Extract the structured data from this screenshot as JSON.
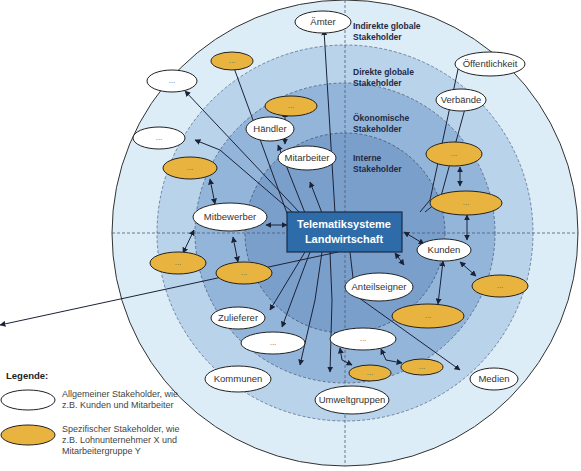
{
  "center": {
    "line1": "Telematiksysteme",
    "line2": "Landwirtschaft",
    "fill": "#2d6ca8"
  },
  "rings": [
    {
      "label1": "Indirekte globale",
      "label2": "Stakeholder",
      "fill": "#dcedf8"
    },
    {
      "label1": "Direkte globale",
      "label2": "Stakeholder",
      "fill": "#b9d3ea"
    },
    {
      "label1": "Ökonomische",
      "label2": "Stakeholder",
      "fill": "#93b5d9"
    },
    {
      "label1": "Interne",
      "label2": "Stakeholder",
      "fill": "#7b9fcb"
    }
  ],
  "general_stakeholders": [
    {
      "label": "Ämter"
    },
    {
      "label": "Öffentlichkeit"
    },
    {
      "label": "Verbände"
    },
    {
      "label": "Händler"
    },
    {
      "label": "Mitarbeiter"
    },
    {
      "label": "Mitbewerber"
    },
    {
      "label": "Kunden"
    },
    {
      "label": "Anteilseigner"
    },
    {
      "label": "Zulieferer"
    },
    {
      "label": "Kommunen"
    },
    {
      "label": "Umweltgruppen"
    },
    {
      "label": "Medien"
    },
    {
      "label": "..."
    },
    {
      "label": "..."
    },
    {
      "label": "..."
    },
    {
      "label": "..."
    }
  ],
  "specific_stakeholder_label": "...",
  "colors": {
    "specific_fill": "#e8b33e",
    "general_fill": "#ffffff",
    "arrow": "#1a2238"
  },
  "legend": {
    "title": "Legende:",
    "general": "Allgemeiner Stakeholder, wie z.B. Kunden und Mitarbeiter",
    "specific": "Spezifischer Stakeholder, wie z.B. Lohnunternehmer X und Mitarbeitergruppe Y"
  }
}
